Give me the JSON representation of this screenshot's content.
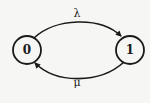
{
  "diagram": {
    "type": "state-transition",
    "nodes": [
      {
        "id": "0",
        "label": "0",
        "cx": 27,
        "cy": 50,
        "r": 14
      },
      {
        "id": "1",
        "label": "1",
        "cx": 130,
        "cy": 50,
        "r": 14
      }
    ],
    "edges": [
      {
        "from": "0",
        "to": "1",
        "label": "λ"
      },
      {
        "from": "1",
        "to": "0",
        "label": "μ"
      }
    ],
    "colors": {
      "stroke": "#1a1a1a",
      "background": "#f6f6f4"
    }
  }
}
